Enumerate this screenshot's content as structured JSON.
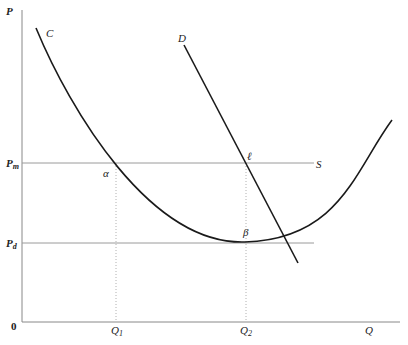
{
  "diagram": {
    "axes": {
      "y_label": "P",
      "x_label": "Q",
      "origin_label": "0"
    },
    "price_levels": [
      {
        "id": "pm",
        "label": "P",
        "subscript": "m"
      },
      {
        "id": "pd",
        "label": "P",
        "subscript": "d"
      }
    ],
    "quantity_levels": [
      {
        "id": "q1",
        "label": "Q",
        "subscript": "1"
      },
      {
        "id": "q2",
        "label": "Q",
        "subscript": "2"
      }
    ],
    "curves": {
      "c": {
        "label": "C",
        "type": "U-shaped cost curve"
      },
      "d": {
        "label": "D",
        "type": "downward-sloping demand line"
      },
      "s": {
        "label": "S",
        "type": "horizontal line at P_m"
      }
    },
    "points": {
      "alpha": "α",
      "beta": "β",
      "ell": "ℓ"
    },
    "colors": {
      "curve": "#1a1a1a",
      "horizontal_lines": "#9a9a9a",
      "dotted_guides": "#b0b0b0",
      "axes": "#888888"
    }
  }
}
